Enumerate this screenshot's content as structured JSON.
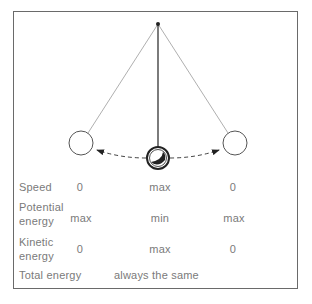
{
  "diagram": {
    "type": "pendulum-energy",
    "positions": [
      "left",
      "center",
      "right"
    ],
    "arrows": "dashed arc arrows from center bob toward left and right bobs"
  },
  "table": {
    "rows": [
      {
        "label_lines": [
          "Speed"
        ],
        "values": [
          "0",
          "max",
          "0"
        ]
      },
      {
        "label_lines": [
          "Potential",
          "energy"
        ],
        "values": [
          "max",
          "min",
          "max"
        ]
      },
      {
        "label_lines": [
          "Kinetic",
          "energy"
        ],
        "values": [
          "0",
          "max",
          "0"
        ]
      },
      {
        "label_lines": [
          "Total energy"
        ],
        "span_value": "always the same"
      }
    ]
  },
  "colors": {
    "text": "#7a7a7a",
    "lines": "#555555",
    "border": "#6a6a6a"
  }
}
